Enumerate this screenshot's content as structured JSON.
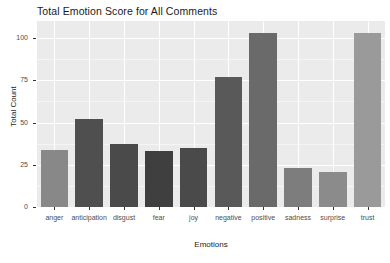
{
  "chart_data": {
    "type": "bar",
    "title": "Total Emotion Score for All Comments",
    "xlabel": "Emotions",
    "ylabel": "Total Count",
    "categories": [
      "anger",
      "anticipation",
      "disgust",
      "fear",
      "joy",
      "negative",
      "positive",
      "sadness",
      "surprise",
      "trust"
    ],
    "values": [
      34,
      52,
      37,
      33,
      35,
      77,
      103,
      23,
      21,
      103
    ],
    "ylim": [
      0,
      110
    ],
    "yticks": [
      0,
      25,
      50,
      75,
      100
    ],
    "ytick_labels": [
      "0",
      "25",
      "50",
      "75",
      "100"
    ],
    "grid": true,
    "legend": "none",
    "bar_colors": [
      "#888888",
      "#4f4f4f",
      "#4a4a4a",
      "#3f3f3f",
      "#4a4a4a",
      "#595959",
      "#6a6a6a",
      "#7d7d7d",
      "#8b8b8b",
      "#9a9a9a"
    ],
    "panel_background": "#ebebeb",
    "gridline_color": "#ffffff",
    "text_color": "#1a1a1a"
  }
}
